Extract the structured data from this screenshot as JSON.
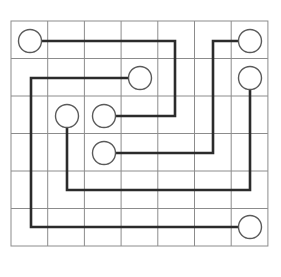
{
  "canvas": {
    "width": 281,
    "height": 277,
    "background": "#ffffff"
  },
  "grid": {
    "label": "puzzle-grid",
    "origin_x": 11,
    "origin_y": 21,
    "cell_width": 36.7,
    "cell_height": 37.5,
    "columns": 7,
    "rows": 6,
    "line_color": "#8c8c8c",
    "line_width": 1,
    "border_color": "#8c8c8c",
    "border_width": 1
  },
  "style": {
    "path_color": "#2b2b2b",
    "path_width": 2.6,
    "node_stroke": "#5a5a5a",
    "node_fill": "#ffffff",
    "node_stroke_width": 1.4,
    "node_radius": 11.5
  },
  "nodes": [
    {
      "id": "node-a1",
      "label": "A",
      "col": 0,
      "row": 0,
      "cx": 30,
      "cy": 41
    },
    {
      "id": "node-b1",
      "label": "B",
      "col": 6,
      "row": 0,
      "cx": 250,
      "cy": 41
    },
    {
      "id": "node-c1",
      "label": "C",
      "col": 3,
      "row": 1,
      "cx": 140,
      "cy": 78
    },
    {
      "id": "node-d1",
      "label": "D",
      "col": 6,
      "row": 1,
      "cx": 250,
      "cy": 78
    },
    {
      "id": "node-e1",
      "label": "E",
      "col": 1,
      "row": 2,
      "cx": 67,
      "cy": 116
    },
    {
      "id": "node-a2",
      "label": "A",
      "col": 2,
      "row": 2,
      "cx": 104,
      "cy": 116
    },
    {
      "id": "node-b2",
      "label": "B",
      "col": 2,
      "row": 3,
      "cx": 104,
      "cy": 153
    },
    {
      "id": "node-c2",
      "label": "C",
      "col": 6,
      "row": 5,
      "cx": 250,
      "cy": 227
    }
  ],
  "paths": [
    {
      "id": "path-a",
      "from": "node-a1",
      "to": "node-a2",
      "points": "30,41 175,41 175,116 104,116"
    },
    {
      "id": "path-b",
      "from": "node-b2",
      "to": "node-b1",
      "points": "104,153 213,153 213,41 250,41"
    },
    {
      "id": "path-c",
      "from": "node-c1",
      "to": "node-c2",
      "points": "140,78 31,78 31,227 250,227"
    },
    {
      "id": "path-d",
      "from": "node-e1",
      "to": "node-d1",
      "points": "67,116 67,190 250,190 250,78"
    }
  ]
}
